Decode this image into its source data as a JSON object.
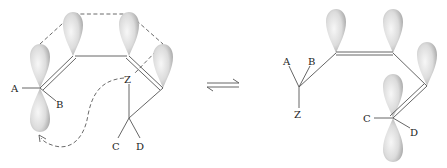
{
  "diagram": {
    "type": "orbital-rearrangement",
    "equilibrium_symbol": "⇌",
    "left_structure": {
      "labels": {
        "a": "A",
        "b": "B",
        "z": "Z",
        "c": "C",
        "d": "D"
      },
      "p_orbital_lobes": 5,
      "annotations": [
        "dashed orbital-overlap outline",
        "dashed curved arrow from Z to lower lobe"
      ]
    },
    "right_structure": {
      "labels": {
        "a": "A",
        "b": "B",
        "z": "Z",
        "c": "C",
        "d": "D"
      },
      "p_orbital_lobes": 5
    },
    "colors": {
      "lobe_light": "#f4f4f4",
      "lobe_dark": "#a8a8a8",
      "line": "#555555"
    }
  }
}
